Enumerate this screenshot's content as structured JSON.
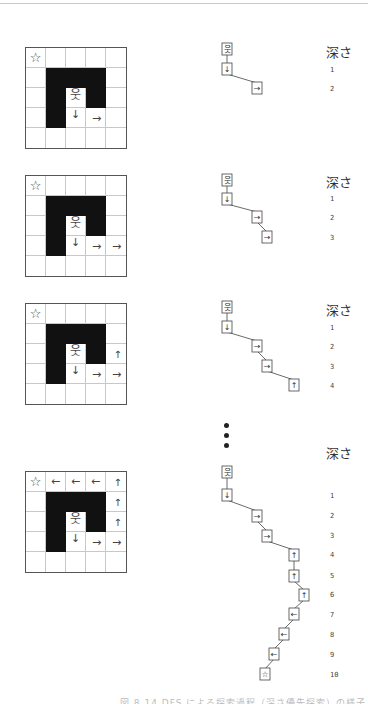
{
  "figure": {
    "depth_header": "深さ",
    "caption": "図 8.14 DFS による探索過程（深さ優先探索）の様子",
    "symbols": {
      "start": "☆",
      "person": "웃",
      "down": "↓",
      "right": "→",
      "up": "↑",
      "left": "←"
    },
    "panels": [
      {
        "id": 1,
        "grid_top": 47,
        "walls": [
          [
            1,
            1
          ],
          [
            1,
            2
          ],
          [
            1,
            3
          ],
          [
            2,
            1
          ],
          [
            2,
            3
          ],
          [
            3,
            1
          ]
        ],
        "marks": [
          {
            "r": 0,
            "c": 0,
            "t": "☆",
            "k": "st"
          },
          {
            "r": 2,
            "c": 2,
            "t": "웃",
            "k": "pr"
          },
          {
            "r": 3,
            "c": 2,
            "t": "↓",
            "k": "dn-top"
          },
          {
            "r": 3,
            "c": 3,
            "t": "→",
            "k": "rt"
          }
        ],
        "tree": {
          "nodes": [
            {
              "x": 227,
              "y": 49,
              "label": "웃"
            },
            {
              "x": 227,
              "y": 69,
              "label": "↓"
            },
            {
              "x": 257,
              "y": 88,
              "label": "→"
            }
          ]
        },
        "depth_title_y": 42,
        "depths": [
          {
            "n": "1",
            "y": 66
          },
          {
            "n": "2",
            "y": 85
          }
        ]
      },
      {
        "id": 2,
        "grid_top": 175,
        "walls": [
          [
            1,
            1
          ],
          [
            1,
            2
          ],
          [
            1,
            3
          ],
          [
            2,
            1
          ],
          [
            2,
            3
          ],
          [
            3,
            1
          ]
        ],
        "marks": [
          {
            "r": 0,
            "c": 0,
            "t": "☆",
            "k": "st"
          },
          {
            "r": 2,
            "c": 2,
            "t": "웃",
            "k": "pr"
          },
          {
            "r": 3,
            "c": 2,
            "t": "↓",
            "k": "dn-top"
          },
          {
            "r": 3,
            "c": 3,
            "t": "→",
            "k": "rt"
          },
          {
            "r": 3,
            "c": 4,
            "t": "→",
            "k": "rt"
          }
        ],
        "tree": {
          "nodes": [
            {
              "x": 227,
              "y": 180,
              "label": "웃"
            },
            {
              "x": 227,
              "y": 199,
              "label": "↓"
            },
            {
              "x": 257,
              "y": 217,
              "label": "→"
            },
            {
              "x": 267,
              "y": 237,
              "label": "→"
            }
          ]
        },
        "depth_title_y": 172,
        "depths": [
          {
            "n": "1",
            "y": 195
          },
          {
            "n": "2",
            "y": 214
          },
          {
            "n": "3",
            "y": 234
          }
        ]
      },
      {
        "id": 3,
        "grid_top": 303,
        "walls": [
          [
            1,
            1
          ],
          [
            1,
            2
          ],
          [
            1,
            3
          ],
          [
            2,
            1
          ],
          [
            2,
            3
          ],
          [
            3,
            1
          ]
        ],
        "marks": [
          {
            "r": 0,
            "c": 0,
            "t": "☆",
            "k": "st"
          },
          {
            "r": 2,
            "c": 2,
            "t": "웃",
            "k": "pr"
          },
          {
            "r": 3,
            "c": 2,
            "t": "↓",
            "k": "dn-top"
          },
          {
            "r": 3,
            "c": 3,
            "t": "→",
            "k": "rt"
          },
          {
            "r": 3,
            "c": 4,
            "t": "→",
            "k": "rt"
          },
          {
            "r": 2,
            "c": 4,
            "t": "↑",
            "k": "up"
          }
        ],
        "tree": {
          "nodes": [
            {
              "x": 227,
              "y": 307,
              "label": "웃"
            },
            {
              "x": 227,
              "y": 327,
              "label": "↓"
            },
            {
              "x": 257,
              "y": 346,
              "label": "→"
            },
            {
              "x": 267,
              "y": 366,
              "label": "→"
            },
            {
              "x": 294,
              "y": 385,
              "label": "↑"
            }
          ]
        },
        "depth_title_y": 300,
        "depths": [
          {
            "n": "1",
            "y": 324
          },
          {
            "n": "2",
            "y": 343
          },
          {
            "n": "3",
            "y": 363
          },
          {
            "n": "4",
            "y": 382
          }
        ]
      },
      {
        "id": 4,
        "grid_top": 471,
        "walls": [
          [
            1,
            1
          ],
          [
            1,
            2
          ],
          [
            1,
            3
          ],
          [
            2,
            1
          ],
          [
            2,
            3
          ],
          [
            3,
            1
          ]
        ],
        "marks": [
          {
            "r": 0,
            "c": 0,
            "t": "☆",
            "k": "st"
          },
          {
            "r": 2,
            "c": 2,
            "t": "웃",
            "k": "pr"
          },
          {
            "r": 3,
            "c": 2,
            "t": "↓",
            "k": "dn-top"
          },
          {
            "r": 3,
            "c": 3,
            "t": "→",
            "k": "rt"
          },
          {
            "r": 3,
            "c": 4,
            "t": "→",
            "k": "rt"
          },
          {
            "r": 2,
            "c": 4,
            "t": "↑",
            "k": "up"
          },
          {
            "r": 1,
            "c": 4,
            "t": "↑",
            "k": "up"
          },
          {
            "r": 0,
            "c": 4,
            "t": "↑",
            "k": "up"
          },
          {
            "r": 0,
            "c": 3,
            "t": "←",
            "k": "lf"
          },
          {
            "r": 0,
            "c": 2,
            "t": "←",
            "k": "lf"
          },
          {
            "r": 0,
            "c": 1,
            "t": "←",
            "k": "lf"
          }
        ],
        "tree": {
          "nodes": [
            {
              "x": 227,
              "y": 472,
              "label": "웃"
            },
            {
              "x": 227,
              "y": 495,
              "label": "↓"
            },
            {
              "x": 257,
              "y": 516,
              "label": "→"
            },
            {
              "x": 267,
              "y": 536,
              "label": "→"
            },
            {
              "x": 294,
              "y": 555,
              "label": "↑"
            },
            {
              "x": 294,
              "y": 576,
              "label": "↑"
            },
            {
              "x": 304,
              "y": 595,
              "label": "↑"
            },
            {
              "x": 294,
              "y": 614,
              "label": "←"
            },
            {
              "x": 284,
              "y": 634,
              "label": "←"
            },
            {
              "x": 274,
              "y": 654,
              "label": "←"
            },
            {
              "x": 265,
              "y": 674,
              "label": "☆"
            }
          ]
        },
        "depth_title_y": 443,
        "depths": [
          {
            "n": "1",
            "y": 492
          },
          {
            "n": "2",
            "y": 512
          },
          {
            "n": "3",
            "y": 532
          },
          {
            "n": "4",
            "y": 551
          },
          {
            "n": "5",
            "y": 572
          },
          {
            "n": "6",
            "y": 591
          },
          {
            "n": "7",
            "y": 611
          },
          {
            "n": "8",
            "y": 631
          },
          {
            "n": "9",
            "y": 651
          },
          {
            "n": "10",
            "y": 671
          }
        ]
      }
    ],
    "ellipsis_dots_y": [
      423,
      433,
      443
    ]
  }
}
